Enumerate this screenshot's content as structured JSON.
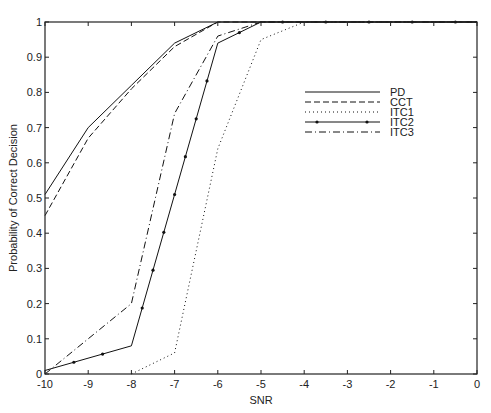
{
  "chart_data": {
    "type": "line",
    "title": "",
    "xlabel": "SNR",
    "ylabel": "Probability of Correct Decision",
    "xlim": [
      -10,
      0
    ],
    "ylim": [
      0,
      1
    ],
    "xticks": [
      "-10",
      "-9",
      "-8",
      "-7",
      "-6",
      "-5",
      "-4",
      "-3",
      "-2",
      "-1",
      "0"
    ],
    "yticks": [
      "0",
      "0.1",
      "0.2",
      "0.3",
      "0.4",
      "0.5",
      "0.6",
      "0.7",
      "0.8",
      "0.9",
      "1"
    ],
    "grid": false,
    "legend_position": "upper right (inside)",
    "series": [
      {
        "name": "PD",
        "style": "solid",
        "x": [
          -10,
          -9,
          -8,
          -7,
          -6,
          -5,
          -4,
          -3,
          -2,
          -1,
          0
        ],
        "values": [
          0.51,
          0.7,
          0.82,
          0.94,
          1.0,
          1.0,
          1.0,
          1.0,
          1.0,
          1.0,
          1.0
        ]
      },
      {
        "name": "CCT",
        "style": "dashed",
        "x": [
          -10,
          -9,
          -8,
          -7,
          -6,
          -5,
          -4,
          -3,
          -2,
          -1,
          0
        ],
        "values": [
          0.45,
          0.67,
          0.81,
          0.93,
          1.0,
          1.0,
          1.0,
          1.0,
          1.0,
          1.0,
          1.0
        ]
      },
      {
        "name": "ITC1",
        "style": "dotted",
        "x": [
          -8,
          -7,
          -6,
          -5,
          -4,
          -3,
          -2,
          -1,
          0
        ],
        "values": [
          0.0,
          0.06,
          0.64,
          0.95,
          1.0,
          1.0,
          1.0,
          1.0,
          1.0
        ]
      },
      {
        "name": "ITC2",
        "style": "solid-dot-markers",
        "x": [
          -10,
          -8,
          -6,
          -5,
          -4,
          -3,
          -2,
          -1,
          0
        ],
        "values": [
          0.01,
          0.08,
          0.94,
          1.0,
          1.0,
          1.0,
          1.0,
          1.0,
          1.0
        ]
      },
      {
        "name": "ITC3",
        "style": "dashdot",
        "x": [
          -10,
          -8,
          -7,
          -6,
          -5,
          -4,
          -3,
          -2,
          -1,
          0
        ],
        "values": [
          0.0,
          0.2,
          0.74,
          0.96,
          1.0,
          1.0,
          1.0,
          1.0,
          1.0,
          1.0
        ]
      }
    ]
  }
}
